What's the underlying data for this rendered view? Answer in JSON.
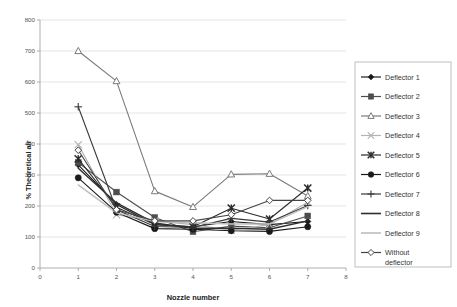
{
  "chart_data": {
    "type": "line",
    "title": "",
    "xlabel": "Nozzle number",
    "ylabel": "% Theoretical air",
    "x": [
      1,
      2,
      3,
      4,
      5,
      6,
      7
    ],
    "xlim": [
      0,
      8
    ],
    "ylim": [
      0,
      800
    ],
    "xticks": [
      "0",
      "1",
      "2",
      "3",
      "4",
      "5",
      "6",
      "7",
      "8"
    ],
    "yticks": [
      "0",
      "100",
      "200",
      "300",
      "400",
      "500",
      "600",
      "700",
      "800"
    ],
    "grid": "horizontal",
    "legend_position": "right-outside",
    "series": [
      {
        "name": "Deflector 1",
        "marker": "diamond-filled",
        "color": "#1a1a1a",
        "values": [
          333,
          205,
          140,
          133,
          150,
          140,
          150
        ]
      },
      {
        "name": "Deflector 2",
        "marker": "square-filled",
        "color": "#4d4d4d",
        "values": [
          340,
          245,
          163,
          117,
          135,
          130,
          168
        ]
      },
      {
        "name": "Deflector 3",
        "marker": "triangle-open",
        "color": "#7a7a7a",
        "values": [
          700,
          603,
          248,
          197,
          302,
          304,
          232
        ]
      },
      {
        "name": "Deflector 4",
        "marker": "asterisk-light",
        "color": "#b3b3b3",
        "values": [
          398,
          172,
          152,
          140,
          122,
          140,
          212
        ]
      },
      {
        "name": "Deflector 5",
        "marker": "asterisk-dark",
        "color": "#2b2b2b",
        "values": [
          352,
          196,
          140,
          133,
          193,
          158,
          258
        ]
      },
      {
        "name": "Deflector 6",
        "marker": "circle-filled",
        "color": "#1a1a1a",
        "values": [
          291,
          180,
          127,
          125,
          120,
          118,
          133
        ]
      },
      {
        "name": "Deflector 7",
        "marker": "plus",
        "color": "#3a3a3a",
        "values": [
          520,
          188,
          134,
          131,
          160,
          148,
          202
        ]
      },
      {
        "name": "Deflector 8",
        "marker": "none",
        "color": "#2e2e2e",
        "values": [
          322,
          210,
          145,
          128,
          128,
          125,
          152
        ]
      },
      {
        "name": "Deflector 9",
        "marker": "none",
        "color": "#bdbdbd",
        "values": [
          268,
          178,
          150,
          146,
          142,
          142,
          198
        ]
      },
      {
        "name": "Without deflector",
        "marker": "diamond-open",
        "color": "#444444",
        "values": [
          380,
          188,
          152,
          152,
          172,
          218,
          218
        ]
      }
    ]
  },
  "legend": {
    "items": [
      {
        "label": "Deflector 1"
      },
      {
        "label": "Deflector 2"
      },
      {
        "label": "Deflector 3"
      },
      {
        "label": "Deflector 4"
      },
      {
        "label": "Deflector 5"
      },
      {
        "label": "Deflector 6"
      },
      {
        "label": "Deflector 7"
      },
      {
        "label": "Deflector 8"
      },
      {
        "label": "Deflector 9"
      },
      {
        "label": "Without"
      },
      {
        "label": "deflector"
      }
    ]
  }
}
